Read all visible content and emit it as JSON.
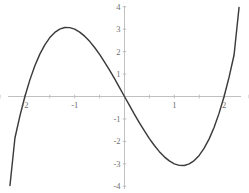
{
  "figure": {
    "width": 249,
    "height": 193,
    "background_color": "#ffffff",
    "curve_color": "#3b3b3b",
    "axis_color": "#b9b9b9",
    "label_color": "#6f6f6f"
  },
  "chart_data": {
    "type": "line",
    "title": "",
    "subtitle": "",
    "xlabel": "",
    "ylabel": "",
    "xlim": [
      -2.5,
      2.5
    ],
    "ylim": [
      -4.3,
      4.3
    ],
    "grid": false,
    "legend": null,
    "legend_position": "none",
    "axis_origin": [
      0,
      0
    ],
    "x_ticks": [
      -2,
      -1,
      1,
      2
    ],
    "x_tick_labels": [
      "-2",
      "-1",
      "1",
      "2"
    ],
    "x_minor_ticks": [
      -2.5,
      -2.0,
      -1.5,
      -1.0,
      -0.5,
      0.5,
      1.0,
      1.5,
      2.0,
      2.5
    ],
    "y_ticks": [
      4,
      3,
      2,
      1,
      -1,
      -2,
      -3,
      -4
    ],
    "y_tick_labels": [
      "4",
      "3",
      "2",
      "1",
      "-1",
      "-2",
      "-3",
      "-4"
    ],
    "series": [
      {
        "name": "y = x^3 - 4x",
        "expression": "x^3 - 4x",
        "color": "#3b3b3b",
        "roots": [
          -2,
          0,
          2
        ],
        "local_maximum": [
          -1.1547,
          3.0792
        ],
        "local_minimum": [
          1.1547,
          -3.0792
        ],
        "x": [
          -2.3,
          -2.2,
          -2.1,
          -2.0,
          -1.9,
          -1.8,
          -1.7,
          -1.6,
          -1.5,
          -1.4,
          -1.3,
          -1.2,
          -1.1,
          -1.0,
          -0.9,
          -0.8,
          -0.7,
          -0.6,
          -0.5,
          -0.4,
          -0.3,
          -0.2,
          -0.1,
          0.0,
          0.1,
          0.2,
          0.3,
          0.4,
          0.5,
          0.6,
          0.7,
          0.8,
          0.9,
          1.0,
          1.1,
          1.2,
          1.3,
          1.4,
          1.5,
          1.6,
          1.7,
          1.8,
          1.9,
          2.0,
          2.1,
          2.2,
          2.3
        ],
        "y": [
          -3.967,
          -1.848,
          -0.861,
          0.0,
          0.741,
          1.368,
          1.887,
          2.304,
          2.625,
          2.856,
          3.003,
          3.072,
          3.069,
          3.0,
          2.871,
          2.688,
          2.457,
          2.184,
          1.875,
          1.536,
          1.173,
          0.792,
          0.399,
          0.0,
          -0.399,
          -0.792,
          -1.173,
          -1.536,
          -1.875,
          -2.184,
          -2.457,
          -2.688,
          -2.871,
          -3.0,
          -3.069,
          -3.072,
          -3.003,
          -2.856,
          -2.625,
          -2.304,
          -1.887,
          -1.368,
          -0.741,
          0.0,
          0.861,
          1.848,
          3.967
        ]
      }
    ]
  }
}
